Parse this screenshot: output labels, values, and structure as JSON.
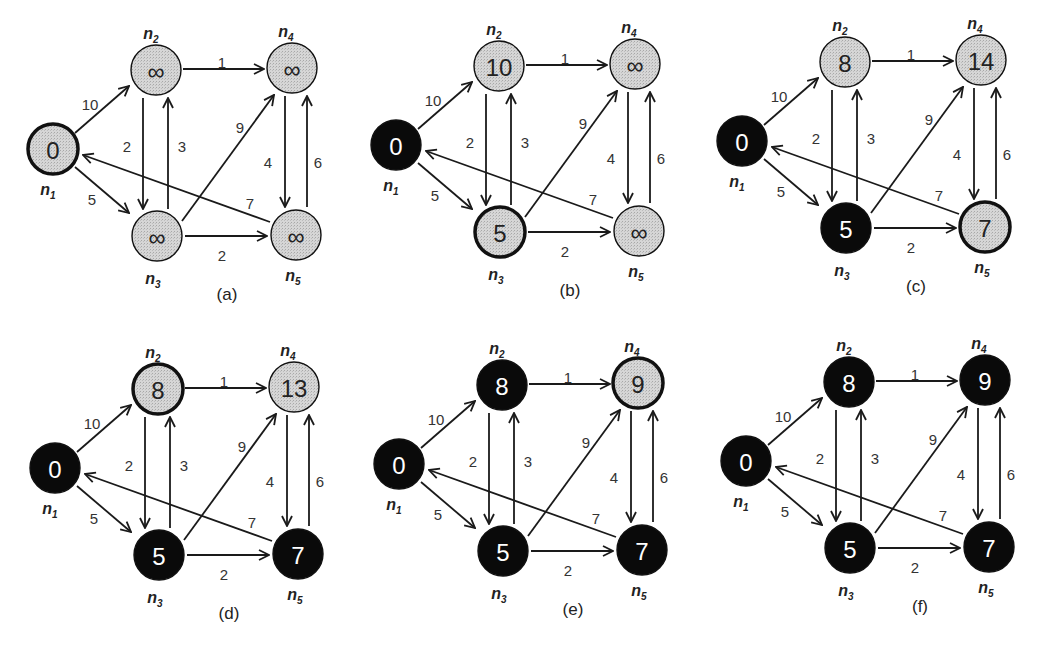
{
  "figure": {
    "colors": {
      "unvisited_fill": "#d4d4d4",
      "visited_fill": "#0a0a0a",
      "edge": "#1a1a1a",
      "text_dark": "#222222",
      "text_light": "#ffffff"
    },
    "nodes": [
      {
        "id": "n1",
        "label": "n",
        "sub": "1"
      },
      {
        "id": "n2",
        "label": "n",
        "sub": "2"
      },
      {
        "id": "n3",
        "label": "n",
        "sub": "3"
      },
      {
        "id": "n4",
        "label": "n",
        "sub": "4"
      },
      {
        "id": "n5",
        "label": "n",
        "sub": "5"
      }
    ],
    "edges": [
      {
        "from": "n1",
        "to": "n2",
        "weight": "10"
      },
      {
        "from": "n1",
        "to": "n3",
        "weight": "5"
      },
      {
        "from": "n2",
        "to": "n4",
        "weight": "1"
      },
      {
        "from": "n2",
        "to": "n3",
        "weight": "2"
      },
      {
        "from": "n3",
        "to": "n2",
        "weight": "3"
      },
      {
        "from": "n3",
        "to": "n4",
        "weight": "9"
      },
      {
        "from": "n3",
        "to": "n5",
        "weight": "2"
      },
      {
        "from": "n4",
        "to": "n5",
        "weight": "4"
      },
      {
        "from": "n5",
        "to": "n4",
        "weight": "6"
      },
      {
        "from": "n5",
        "to": "n1",
        "weight": "7"
      }
    ],
    "panels": [
      {
        "caption": "(a)",
        "states": {
          "n1": {
            "value": "0",
            "state": "current"
          },
          "n2": {
            "value": "∞",
            "state": "unvisited"
          },
          "n3": {
            "value": "∞",
            "state": "unvisited"
          },
          "n4": {
            "value": "∞",
            "state": "unvisited"
          },
          "n5": {
            "value": "∞",
            "state": "unvisited"
          }
        }
      },
      {
        "caption": "(b)",
        "states": {
          "n1": {
            "value": "0",
            "state": "visited"
          },
          "n2": {
            "value": "10",
            "state": "unvisited"
          },
          "n3": {
            "value": "5",
            "state": "current"
          },
          "n4": {
            "value": "∞",
            "state": "unvisited"
          },
          "n5": {
            "value": "∞",
            "state": "unvisited"
          }
        }
      },
      {
        "caption": "(c)",
        "states": {
          "n1": {
            "value": "0",
            "state": "visited"
          },
          "n2": {
            "value": "8",
            "state": "unvisited"
          },
          "n3": {
            "value": "5",
            "state": "visited"
          },
          "n4": {
            "value": "14",
            "state": "unvisited"
          },
          "n5": {
            "value": "7",
            "state": "current"
          }
        }
      },
      {
        "caption": "(d)",
        "states": {
          "n1": {
            "value": "0",
            "state": "visited"
          },
          "n2": {
            "value": "8",
            "state": "current"
          },
          "n3": {
            "value": "5",
            "state": "visited"
          },
          "n4": {
            "value": "13",
            "state": "unvisited"
          },
          "n5": {
            "value": "7",
            "state": "visited"
          }
        }
      },
      {
        "caption": "(e)",
        "states": {
          "n1": {
            "value": "0",
            "state": "visited"
          },
          "n2": {
            "value": "8",
            "state": "visited"
          },
          "n3": {
            "value": "5",
            "state": "visited"
          },
          "n4": {
            "value": "9",
            "state": "current"
          },
          "n5": {
            "value": "7",
            "state": "visited"
          }
        }
      },
      {
        "caption": "(f)",
        "states": {
          "n1": {
            "value": "0",
            "state": "visited"
          },
          "n2": {
            "value": "8",
            "state": "visited"
          },
          "n3": {
            "value": "5",
            "state": "visited"
          },
          "n4": {
            "value": "9",
            "state": "visited"
          },
          "n5": {
            "value": "7",
            "state": "visited"
          }
        }
      }
    ]
  }
}
